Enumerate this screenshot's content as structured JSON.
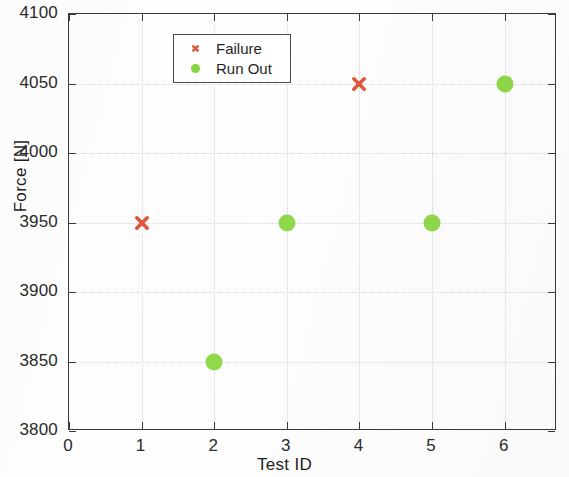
{
  "chart_data": {
    "type": "scatter",
    "title": "",
    "xlabel": "Test ID",
    "ylabel": "Force [N]",
    "xlim": [
      0,
      6.72
    ],
    "ylim": [
      3800,
      4100
    ],
    "xticks": [
      0,
      1,
      2,
      3,
      4,
      5,
      6
    ],
    "yticks": [
      3800,
      3850,
      3900,
      3950,
      4000,
      4050,
      4100
    ],
    "xtick_labels": [
      "0",
      "1",
      "2",
      "3",
      "4",
      "5",
      "6"
    ],
    "ytick_labels": [
      "3800",
      "3850",
      "3900",
      "3950",
      "4000",
      "4050",
      "4100"
    ],
    "grid": true,
    "legend_position": "upper left",
    "series": [
      {
        "name": "Failure",
        "marker": "x",
        "color": "#e2553c",
        "points": [
          {
            "x": 1,
            "y": 3950
          },
          {
            "x": 4,
            "y": 4050
          }
        ]
      },
      {
        "name": "Run Out",
        "marker": "o",
        "color": "#86d63c",
        "points": [
          {
            "x": 2,
            "y": 3850
          },
          {
            "x": 3,
            "y": 3950
          },
          {
            "x": 5,
            "y": 3950
          },
          {
            "x": 6,
            "y": 4050
          }
        ]
      }
    ]
  },
  "legend": {
    "entries": [
      {
        "label": "Failure",
        "marker": "x-marker-icon"
      },
      {
        "label": "Run Out",
        "marker": "circle-marker-icon"
      }
    ]
  },
  "axes": {
    "xlabel": "Test ID",
    "ylabel": "Force [N]"
  },
  "colors": {
    "failure": "#e2553c",
    "run_out": "#86d63c",
    "axis": "#3a3a3a",
    "grid": "#d8d8d8",
    "text": "#1f1f1f"
  }
}
